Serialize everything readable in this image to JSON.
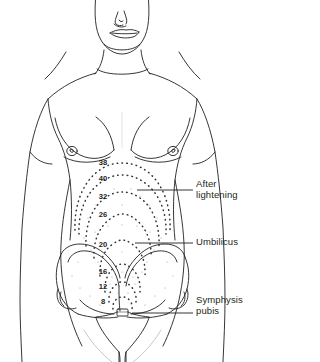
{
  "figure": {
    "line_color": "#231f20",
    "dot_color": "#4a4a4a",
    "background": "#ffffff"
  },
  "week_markers": [
    {
      "label": "38",
      "x": 103,
      "y": 162
    },
    {
      "label": "40",
      "x": 103,
      "y": 178
    },
    {
      "label": "32",
      "x": 103,
      "y": 196
    },
    {
      "label": "26",
      "x": 103,
      "y": 214
    },
    {
      "label": "20",
      "x": 103,
      "y": 244
    },
    {
      "label": "16",
      "x": 103,
      "y": 271
    },
    {
      "label": "12",
      "x": 103,
      "y": 286
    },
    {
      "label": "8",
      "x": 103,
      "y": 301
    }
  ],
  "callouts": [
    {
      "name": "after-lightening",
      "text": "After\nlightening",
      "leader": {
        "x1": 137,
        "y1": 190,
        "x2": 193,
        "y2": 190
      }
    },
    {
      "name": "umbilicus",
      "text": "Umbilicus",
      "leader": {
        "x1": 135,
        "y1": 243,
        "x2": 193,
        "y2": 243
      }
    },
    {
      "name": "symphysis-pubis",
      "text": "Symphysis\npubis",
      "leader": {
        "x1": 132,
        "y1": 313,
        "x2": 193,
        "y2": 313
      }
    }
  ],
  "anatomy_parts": [
    "head",
    "nose",
    "mouth",
    "chin",
    "neck",
    "shoulders",
    "left-arm",
    "right-arm",
    "left-breast",
    "right-breast",
    "left-nipple",
    "right-nipple",
    "torso-outline",
    "iliac-crest-left",
    "iliac-crest-right",
    "pelvic-brim",
    "pubic-symphysis",
    "thighs"
  ]
}
